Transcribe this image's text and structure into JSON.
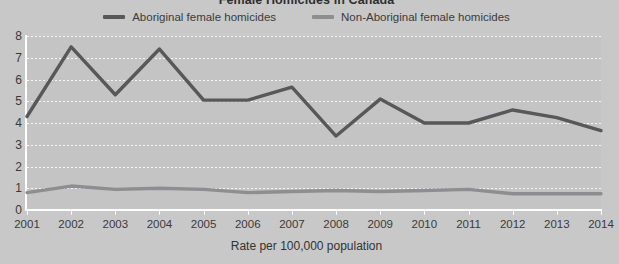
{
  "chart_data": {
    "type": "line",
    "title": "Female Homicides in Canada",
    "xlabel": "Rate per 100,000 population",
    "ylabel": "",
    "categories": [
      "2001",
      "2002",
      "2003",
      "2004",
      "2005",
      "2006",
      "2007",
      "2008",
      "2009",
      "2010",
      "2011",
      "2012",
      "2013",
      "2014"
    ],
    "x": [
      2001,
      2002,
      2003,
      2004,
      2005,
      2006,
      2007,
      2008,
      2009,
      2010,
      2011,
      2012,
      2013,
      2014
    ],
    "ylim": [
      0,
      8
    ],
    "xlim": [
      2001,
      2014
    ],
    "yticks": [
      0,
      1,
      2,
      3,
      4,
      5,
      6,
      7,
      8
    ],
    "grid": true,
    "legend_position": "top-center",
    "series": [
      {
        "name": "Aboriginal female homicides",
        "color": "#58585a",
        "values": [
          4.3,
          7.5,
          5.3,
          7.4,
          5.05,
          5.05,
          5.65,
          3.4,
          5.1,
          4.0,
          4.0,
          4.6,
          4.25,
          3.65
        ]
      },
      {
        "name": "Non-Aboriginal female homicides",
        "color": "#8e8e90",
        "values": [
          0.8,
          1.1,
          0.95,
          1.0,
          0.95,
          0.8,
          0.85,
          0.9,
          0.85,
          0.9,
          0.95,
          0.75,
          0.75,
          0.75
        ]
      }
    ],
    "ytick_labels": [
      "8",
      "7",
      "6",
      "5",
      "4",
      "3",
      "2",
      "1",
      "0"
    ]
  },
  "legend": {
    "items": [
      {
        "label": "Aboriginal female homicides",
        "swatch": "dark"
      },
      {
        "label": "Non-Aboriginal female homicides",
        "swatch": "light"
      }
    ]
  },
  "colors": {
    "background": "#c8c8c8",
    "plot_background": "#c4c4c4",
    "aboriginal_line": "#58585a",
    "non_aboriginal_line": "#8e8e90",
    "gridline": "#ffffff",
    "text": "#3a3a3a"
  }
}
